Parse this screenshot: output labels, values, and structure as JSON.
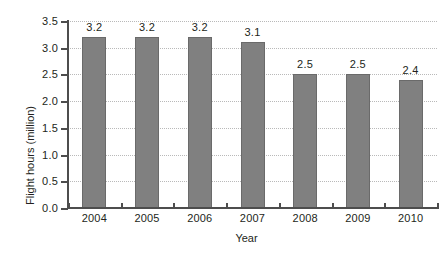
{
  "chart_data": {
    "type": "bar",
    "title": "",
    "xlabel": "Year",
    "ylabel": "Flight hours (million)",
    "categories": [
      "2004",
      "2005",
      "2006",
      "2007",
      "2008",
      "2009",
      "2010"
    ],
    "values": [
      3.2,
      3.2,
      3.2,
      3.1,
      2.5,
      2.5,
      2.4
    ],
    "value_labels": [
      "3.2",
      "3.2",
      "3.2",
      "3.1",
      "2.5",
      "2.5",
      "2.4"
    ],
    "ylim": [
      0.0,
      3.5
    ],
    "ytick_labels": [
      "0.0",
      "0.5",
      "1.0",
      "1.5",
      "2.0",
      "2.5",
      "3.0",
      "3.5"
    ],
    "ytick_values": [
      0.0,
      0.5,
      1.0,
      1.5,
      2.0,
      2.5,
      3.0,
      3.5
    ],
    "grid": "horizontal-dotted",
    "legend": "none",
    "bar_color": "#808080",
    "bar_edge_color": "#6a6a6a",
    "axis_color": "#4d4d4d",
    "grid_color": "#b9b9b9",
    "text_color": "#231f20",
    "background_color": "#ffffff"
  }
}
